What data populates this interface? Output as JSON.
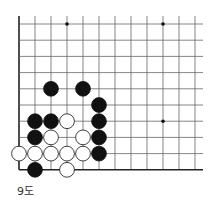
{
  "diagram": {
    "caption": "9도",
    "grid": {
      "x0": 19,
      "y0": 24,
      "dx": 16,
      "dy": 16.2,
      "cols": 12,
      "rows": 10,
      "right_edge": 203
    },
    "star_points": [
      [
        3,
        0
      ],
      [
        9,
        0
      ],
      [
        9,
        6
      ]
    ],
    "stones": [
      {
        "c": 2,
        "r": 4,
        "color": "black"
      },
      {
        "c": 4,
        "r": 4,
        "color": "black"
      },
      {
        "c": 5,
        "r": 5,
        "color": "black"
      },
      {
        "c": 1,
        "r": 6,
        "color": "black"
      },
      {
        "c": 2,
        "r": 6,
        "color": "black"
      },
      {
        "c": 3,
        "r": 6,
        "color": "white"
      },
      {
        "c": 5,
        "r": 6,
        "color": "black"
      },
      {
        "c": 1,
        "r": 7,
        "color": "black"
      },
      {
        "c": 2,
        "r": 7,
        "color": "white"
      },
      {
        "c": 4,
        "r": 7,
        "color": "white"
      },
      {
        "c": 5,
        "r": 7,
        "color": "black"
      },
      {
        "c": 0,
        "r": 8,
        "color": "white"
      },
      {
        "c": 1,
        "r": 8,
        "color": "white"
      },
      {
        "c": 2,
        "r": 8,
        "color": "white"
      },
      {
        "c": 3,
        "r": 8,
        "color": "white"
      },
      {
        "c": 4,
        "r": 8,
        "color": "white"
      },
      {
        "c": 5,
        "r": 8,
        "color": "black"
      },
      {
        "c": 1,
        "r": 9,
        "color": "black"
      },
      {
        "c": 3,
        "r": 9,
        "color": "white"
      }
    ]
  }
}
